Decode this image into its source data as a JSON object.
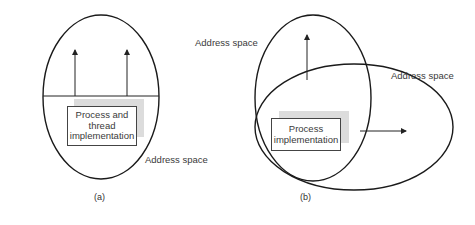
{
  "diagram": {
    "panel_a": {
      "caption": "(a)",
      "box_label_lines": [
        "Process and",
        "thread",
        "implementation"
      ],
      "address_space_label": "Address space",
      "thread_arrows": 2
    },
    "panel_b": {
      "caption": "(b)",
      "box_label_lines": [
        "Process",
        "implementation"
      ],
      "address_space_label_1": "Address space",
      "address_space_label_2": "Address space",
      "thread_arrows": 2
    },
    "colors": {
      "line": "#1a1a1a",
      "shadow": "#dcdcdc",
      "text": "#3a3a3a"
    }
  }
}
